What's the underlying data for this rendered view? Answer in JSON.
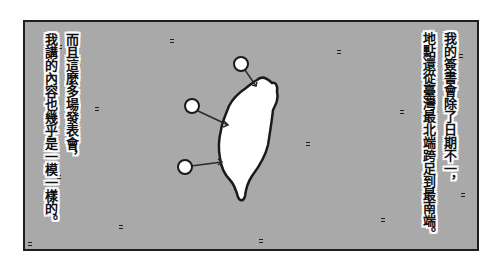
{
  "panel": {
    "background_color": "#a9a9a9",
    "border_color": "#1e1e1e"
  },
  "captions": {
    "right": {
      "line1": "我的簽書會除了日期不一，",
      "line2": "地點還從臺灣最北端跨足到最南端。"
    },
    "left": {
      "line1": "而且這麼多場發表會，",
      "line2": "我講的內容也幾乎是一模一樣的。"
    }
  },
  "map": {
    "subject": "taiwan-island",
    "island_fill": "#ffffff",
    "outline_color": "#1a1a1a",
    "markers": [
      {
        "label": "north",
        "cx": 241,
        "cy": 64
      },
      {
        "label": "middle",
        "cx": 192,
        "cy": 106
      },
      {
        "label": "south",
        "cx": 185,
        "cy": 167
      }
    ]
  }
}
